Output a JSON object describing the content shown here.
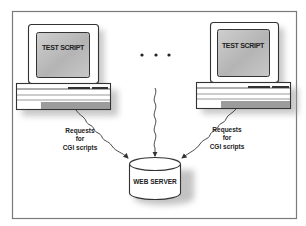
{
  "diagram": {
    "clients": [
      {
        "id": "left",
        "screen_label": "TEST SCRIPT",
        "request_label": [
          "Requests",
          "for",
          "CGI scripts"
        ]
      },
      {
        "id": "right",
        "screen_label": "TEST SCRIPT",
        "request_label": [
          "Requests",
          "for",
          "CGI scripts"
        ]
      }
    ],
    "ellipsis": "• • •",
    "server": {
      "label": "WEB SERVER"
    },
    "colors": {
      "frame": "#7a7a7a",
      "outline": "#333333",
      "screen_fill": "#b8b8b8",
      "screen_light": "#d8d8d8",
      "shadow": "#9a9a9a",
      "background": "#ffffff"
    }
  }
}
